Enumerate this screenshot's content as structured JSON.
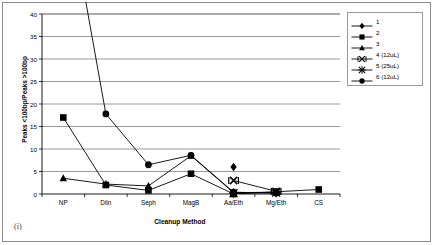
{
  "figure": {
    "caption": "(i)"
  },
  "chart_data": {
    "type": "line",
    "title": "",
    "xlabel": "Cleanup Method",
    "ylabel": "Peaks <100bp/Peaks >100bp",
    "categories": [
      "NP",
      "Diln",
      "Seph",
      "MagB",
      "Aa/Eth",
      "Mg/Eth",
      "CS"
    ],
    "ylim": [
      0,
      40
    ],
    "yticks": [
      0,
      5,
      10,
      15,
      20,
      25,
      30,
      35,
      40
    ],
    "grid": "horizontal",
    "legend_position": "right",
    "series": [
      {
        "name": "1",
        "marker": "diamond-filled",
        "values": [
          null,
          null,
          null,
          null,
          6.0,
          null,
          null
        ]
      },
      {
        "name": "2",
        "marker": "square-filled",
        "values": [
          17.0,
          2.0,
          0.8,
          4.5,
          0.0,
          0.5,
          1.0
        ]
      },
      {
        "name": "3",
        "marker": "triangle-filled",
        "values": [
          3.5,
          2.2,
          1.8,
          8.5,
          0.3,
          0.4,
          null
        ]
      },
      {
        "name": "4 (12uL)",
        "marker": "x-cross",
        "values": [
          null,
          null,
          null,
          null,
          3.0,
          0.6,
          null
        ]
      },
      {
        "name": "5 (25uL)",
        "marker": "star-asterisk",
        "values": [
          null,
          null,
          null,
          null,
          0.2,
          0.3,
          null
        ]
      },
      {
        "name": "6 (12uL)",
        "marker": "circle-filled",
        "values": [
          null,
          17.8,
          6.5,
          8.6,
          0.4,
          0.2,
          null
        ]
      }
    ]
  },
  "legend": {
    "entries": [
      {
        "label": "1",
        "marker": "diamond-filled"
      },
      {
        "label": "2",
        "marker": "square-filled"
      },
      {
        "label": "3",
        "marker": "triangle-filled"
      },
      {
        "label": "4 (12uL)",
        "marker": "x-cross"
      },
      {
        "label": "5 (25uL)",
        "marker": "star-asterisk"
      },
      {
        "label": "6 (12uL)",
        "marker": "circle-filled"
      }
    ]
  }
}
